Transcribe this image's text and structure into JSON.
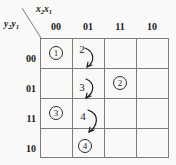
{
  "kmap": {
    "column_variable_label": "x2x1",
    "column_variable_main": "x",
    "row_variable_label": "y2y1",
    "column_headers": [
      "00",
      "01",
      "11",
      "10"
    ],
    "row_headers": [
      "00",
      "01",
      "11",
      "10"
    ],
    "grid": {
      "rows": 4,
      "columns": 4,
      "line_color": "#7d7d7d",
      "background_color": "#faf9f7",
      "text_color": "#1b1b1b"
    },
    "cells": [
      {
        "row": "00",
        "column": "00",
        "value": "1",
        "style": "circled"
      },
      {
        "row": "00",
        "column": "01",
        "value": "2",
        "style": "plain"
      },
      {
        "row": "00",
        "column": "11",
        "value": "",
        "style": "empty"
      },
      {
        "row": "00",
        "column": "10",
        "value": "",
        "style": "empty"
      },
      {
        "row": "01",
        "column": "00",
        "value": "",
        "style": "empty"
      },
      {
        "row": "01",
        "column": "01",
        "value": "3",
        "style": "plain"
      },
      {
        "row": "01",
        "column": "11",
        "value": "2",
        "style": "circled"
      },
      {
        "row": "01",
        "column": "10",
        "value": "",
        "style": "empty"
      },
      {
        "row": "11",
        "column": "00",
        "value": "3",
        "style": "circled"
      },
      {
        "row": "11",
        "column": "01",
        "value": "4",
        "style": "plain"
      },
      {
        "row": "11",
        "column": "11",
        "value": "",
        "style": "empty"
      },
      {
        "row": "11",
        "column": "10",
        "value": "",
        "style": "empty"
      },
      {
        "row": "10",
        "column": "00",
        "value": "",
        "style": "empty"
      },
      {
        "row": "10",
        "column": "01",
        "value": "4",
        "style": "circled"
      },
      {
        "row": "10",
        "column": "11",
        "value": "",
        "style": "empty"
      },
      {
        "row": "10",
        "column": "10",
        "value": "",
        "style": "empty"
      }
    ],
    "arrows": [
      {
        "from": "2",
        "to": "3",
        "name": "arrow-2-to-3"
      },
      {
        "from": "3",
        "to": "4",
        "name": "arrow-3-to-4"
      },
      {
        "from": "4",
        "to": "circled-4",
        "name": "arrow-4-to-circled-4"
      }
    ]
  }
}
